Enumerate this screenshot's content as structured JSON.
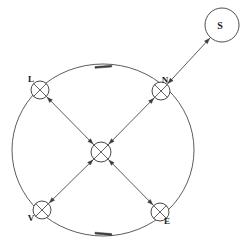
{
  "figure": {
    "title": "",
    "background_color": "#ffffff",
    "line_color": "#4a4a4a",
    "node_fill_color": "#ffffff",
    "node_shade_color": "#6f6f6f"
  },
  "orbit": {
    "name": "orbit-ring",
    "center_x": 103,
    "center_y": 150,
    "radius": 88,
    "direction_markers": [
      {
        "label": "",
        "x": 103,
        "y": 65,
        "angle": 8
      },
      {
        "label": "",
        "x": 103,
        "y": 235,
        "angle": -8
      }
    ]
  },
  "nodes": [
    {
      "id": "L",
      "label": "L",
      "x": 40,
      "y": 90,
      "r": 9,
      "label_dx": -9,
      "label_dy": -8
    },
    {
      "id": "N",
      "label": "N",
      "x": 161,
      "y": 91,
      "r": 9,
      "label_dx": 4,
      "label_dy": -8
    },
    {
      "id": "C",
      "label": "",
      "x": 101,
      "y": 152,
      "r": 10,
      "label_dx": 0,
      "label_dy": 0
    },
    {
      "id": "V",
      "label": "V",
      "x": 42,
      "y": 210,
      "r": 9,
      "label_dx": -11,
      "label_dy": 11
    },
    {
      "id": "E",
      "label": "E",
      "x": 160,
      "y": 212,
      "r": 9,
      "label_dx": 7,
      "label_dy": 12
    }
  ],
  "satellite": {
    "id": "S",
    "label": "S",
    "x": 222,
    "y": 25,
    "r": 17
  },
  "edges": [
    {
      "from": "L",
      "to": "C"
    },
    {
      "from": "N",
      "to": "C"
    },
    {
      "from": "V",
      "to": "C"
    },
    {
      "from": "E",
      "to": "C"
    },
    {
      "from": "N",
      "to": "S"
    }
  ]
}
